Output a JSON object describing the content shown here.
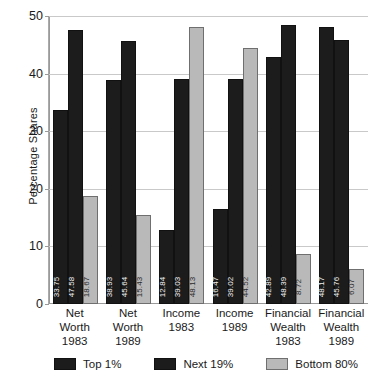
{
  "chart_data": {
    "type": "bar",
    "title": "",
    "xlabel": "",
    "ylabel": "Percentage Shares",
    "ylim": [
      0,
      50
    ],
    "yticks": [
      0,
      10,
      20,
      30,
      40,
      50
    ],
    "grid": true,
    "legend_position": "bottom",
    "categories": [
      "Net Worth 1983",
      "Net Worth 1989",
      "Income 1983",
      "Income 1989",
      "Financial Wealth 1983",
      "Financial Wealth 1989"
    ],
    "category_lines": [
      [
        "Net",
        "Worth",
        "1983"
      ],
      [
        "Net",
        "Worth",
        "1989"
      ],
      [
        "Income",
        "1983"
      ],
      [
        "Income",
        "1989"
      ],
      [
        "Financial",
        "Wealth",
        "1983"
      ],
      [
        "Financial",
        "Wealth",
        "1989"
      ]
    ],
    "series": [
      {
        "name": "Top 1%",
        "color": "#1c1c1c",
        "values": [
          33.75,
          38.93,
          12.84,
          16.47,
          42.89,
          48.17
        ],
        "labels": [
          "33.75",
          "38.93",
          "12.84",
          "16.47",
          "42.89",
          "48.17"
        ]
      },
      {
        "name": "Next 19%",
        "color": "#1c1c1c",
        "values": [
          47.58,
          45.64,
          39.03,
          39.02,
          48.39,
          45.76
        ],
        "labels": [
          "47.58",
          "45.64",
          "39.03",
          "39.02",
          "48.39",
          "45.76"
        ]
      },
      {
        "name": "Bottom 80%",
        "color": "#b9b9b9",
        "values": [
          18.67,
          15.43,
          48.13,
          44.52,
          8.72,
          6.07
        ],
        "labels": [
          "18.67",
          "15.43",
          "48.13",
          "44.52",
          "8.72",
          "6.07"
        ]
      }
    ]
  }
}
